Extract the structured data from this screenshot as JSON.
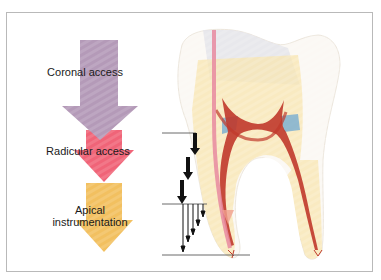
{
  "diagram": {
    "stages": [
      {
        "label": "Coronal access",
        "color": "#b49ab8"
      },
      {
        "label": "Radicular access",
        "color": "#f06478"
      },
      {
        "label": "Apical",
        "label_line2": "instrumentation",
        "color": "#f2c060"
      }
    ],
    "depth_markers": {
      "lines": 3,
      "step_arrows": 3,
      "apical_arrows": 5
    },
    "colors": {
      "frame_border": "#b9b9b9",
      "pulp": "#c0392b",
      "calcification": "#7fb0d0",
      "instrument": "#e88aa0",
      "dentin": "#f8e6b0"
    }
  }
}
